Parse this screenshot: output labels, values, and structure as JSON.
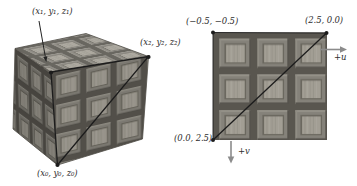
{
  "figure": {
    "object_view": {
      "vertex_labels": {
        "v1": "(x₁, y₁, z₁)",
        "v2": "(x₂, y₂, z₂)",
        "v0": "(x₀, y₀, z₀)"
      }
    },
    "texture_view": {
      "corner_labels": {
        "top_left": "(−0.5, −0.5)",
        "top_right": "(2.5, 0.0)",
        "bottom_left": "(0.0, 2.5)"
      },
      "axis_labels": {
        "u": "+u",
        "v": "+v"
      }
    }
  },
  "colors": {
    "background": "#ffffff",
    "tile_gap": "#59564f",
    "tile_frame": "#85827a",
    "tile_recess": "#6b685f",
    "tile_panel": "#a29e94",
    "line": "#1c1c1c",
    "axis_arrow": "#8b8b8b"
  }
}
